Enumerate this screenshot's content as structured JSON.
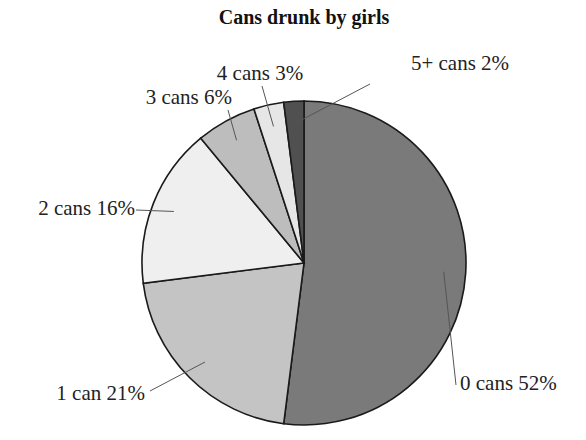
{
  "chart_data": {
    "type": "pie",
    "title": "Cans drunk by girls",
    "categories": [
      "0 cans",
      "1 can",
      "2 cans",
      "3 cans",
      "4 cans",
      "5+ cans"
    ],
    "values": [
      52,
      21,
      16,
      6,
      3,
      2
    ],
    "unit": "%",
    "labels": [
      "0 cans 52%",
      "1 can 21%",
      "2 cans 16%",
      "3 cans 6%",
      "4 cans 3%",
      "5+ cans 2%"
    ],
    "colors": [
      "#7a7a7a",
      "#c4c4c4",
      "#efefef",
      "#bdbdbd",
      "#e6e6e6",
      "#505050"
    ],
    "start_angle": "12 o'clock",
    "direction": "clockwise",
    "legend": "none (leader-line labels)"
  }
}
